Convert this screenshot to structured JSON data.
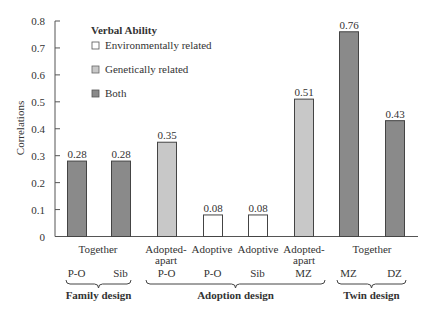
{
  "chart_data": {
    "type": "bar",
    "title": "Verbal Ability",
    "ylabel": "Correlations",
    "xlabel": "",
    "ylim": [
      0,
      0.8
    ],
    "yticks": [
      "0",
      "0.1",
      "0.2",
      "0.3",
      "0.4",
      "0.5",
      "0.6",
      "0.7",
      "0.8"
    ],
    "grid": false,
    "legend_position": "top-left inside",
    "legend": [
      {
        "name": "Environmentally related",
        "color": "#ffffff"
      },
      {
        "name": "Genetically related",
        "color": "#c8c8c8"
      },
      {
        "name": "Both",
        "color": "#8a8a8a"
      }
    ],
    "categories": [
      "Family P-O (Together)",
      "Family Sib (Together)",
      "Adopted-apart P-O",
      "Adoptive P-O",
      "Adoptive Sib",
      "Adopted-apart MZ",
      "Twin MZ (Together)",
      "Twin DZ (Together)"
    ],
    "values": [
      0.28,
      0.28,
      0.35,
      0.08,
      0.08,
      0.51,
      0.76,
      0.43
    ],
    "value_labels": [
      "0.28",
      "0.28",
      "0.35",
      "0.08",
      "0.08",
      "0.51",
      "0.76",
      "0.43"
    ],
    "bar_types": [
      "Both",
      "Both",
      "Genetically related",
      "Environmentally related",
      "Environmentally related",
      "Genetically related",
      "Both",
      "Both"
    ],
    "bar_colors": [
      "#8a8a8a",
      "#8a8a8a",
      "#c8c8c8",
      "#ffffff",
      "#ffffff",
      "#c8c8c8",
      "#8a8a8a",
      "#8a8a8a"
    ],
    "category_top_labels": [
      {
        "text": "Together",
        "center": 98
      },
      {
        "text": "Adopted-",
        "text2": "apart",
        "center": 166
      },
      {
        "text": "Adoptive",
        "center": 212
      },
      {
        "text": "Adoptive",
        "center": 258
      },
      {
        "text": "Adopted-",
        "text2": "apart",
        "center": 304
      },
      {
        "text": "Together",
        "center": 372
      }
    ],
    "relation_labels": [
      "P-O",
      "Sib",
      "P-O",
      "P-O",
      "Sib",
      "MZ",
      "MZ",
      "DZ"
    ],
    "groups": [
      {
        "name": "Family design",
        "start": 66,
        "end": 131
      },
      {
        "name": "Adoption design",
        "start": 146,
        "end": 325
      },
      {
        "name": "Twin design",
        "start": 337,
        "end": 406
      }
    ]
  }
}
